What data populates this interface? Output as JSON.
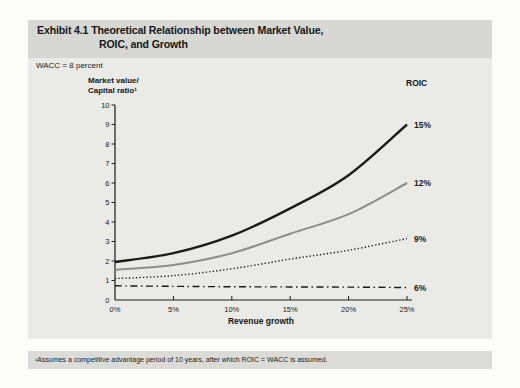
{
  "exhibit": {
    "title_line1": "Exhibit 4.1 Theoretical Relationship between Market Value,",
    "title_line2": "ROIC, and Growth",
    "footnote": "¹Assumes a competitive advantage period of 10 years, after which ROIC = WACC is assumed.",
    "colors": {
      "page_background": "#fcfcfb",
      "title_band": "#d7d7d3",
      "panel_body": "#eaeae6",
      "footnote_band": "#dbdbd7",
      "ink": "#1c1c1c",
      "gray_series": "#8d8d8d"
    }
  },
  "chart_data": {
    "type": "line",
    "title": "Exhibit 4.1 Theoretical Relationship between Market Value, ROIC, and Growth",
    "wacc_note": "WACC = 8 percent",
    "xlabel": "Revenue growth",
    "ylabel_line1": "Market value/",
    "ylabel_line2": "Capital ratio¹",
    "legend_title": "ROIC",
    "legend_position": "right-of-curve-ends",
    "grid": false,
    "x": [
      0,
      5,
      10,
      15,
      20,
      25
    ],
    "x_tick_labels": [
      "0%",
      "5%",
      "10%",
      "15%",
      "20%",
      "25%"
    ],
    "xlim": [
      0,
      25
    ],
    "yticks": [
      0,
      1,
      2,
      3,
      4,
      5,
      6,
      7,
      8,
      9,
      10
    ],
    "ylim": [
      0,
      10
    ],
    "series": [
      {
        "name": "15%",
        "values": [
          1.95,
          2.4,
          3.3,
          4.7,
          6.4,
          9.0
        ],
        "color": "#1a1a1a",
        "width": 2.4,
        "dash": "",
        "style": "solid"
      },
      {
        "name": "12%",
        "values": [
          1.55,
          1.8,
          2.4,
          3.4,
          4.4,
          6.0
        ],
        "color": "#8d8d8d",
        "width": 2.0,
        "dash": "",
        "style": "solid"
      },
      {
        "name": "9%",
        "values": [
          1.1,
          1.25,
          1.6,
          2.1,
          2.55,
          3.15
        ],
        "color": "#1a1a1a",
        "width": 1.4,
        "dash": "1.3 2.2",
        "style": "dotted"
      },
      {
        "name": "6%",
        "values": [
          0.73,
          0.7,
          0.68,
          0.67,
          0.66,
          0.64
        ],
        "color": "#1a1a1a",
        "width": 1.4,
        "dash": "7 3.5 1.5 3.5",
        "style": "dash-dot"
      }
    ]
  }
}
